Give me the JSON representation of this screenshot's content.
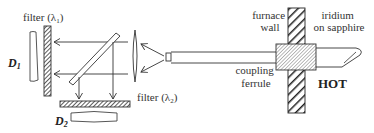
{
  "diagram": {
    "type": "optical-pyrometer-setup",
    "labels": {
      "filter1": "filter (λ",
      "filter1_sub": "1",
      "filter1_close": ")",
      "filter2": "filter (λ",
      "filter2_sub": "2",
      "filter2_close": ")",
      "detector1": "D",
      "detector1_sub": "1",
      "detector2": "D",
      "detector2_sub": "2",
      "furnace_wall_line1": "furnace",
      "furnace_wall_line2": "wall",
      "iridium_line1": "iridium",
      "iridium_line2": "on sapphire",
      "ferrule_line1": "coupling",
      "ferrule_line2": "ferrule",
      "hot": "HOT"
    },
    "components": [
      "detector-D1",
      "filter-lambda1",
      "beam-splitter",
      "filter-lambda2",
      "detector-D2",
      "converging-lens",
      "optical-fiber",
      "coupling-ferrule",
      "furnace-wall",
      "iridium-coated-sapphire-rod"
    ],
    "colors": {
      "line": "#333333",
      "background": "#ffffff"
    }
  }
}
